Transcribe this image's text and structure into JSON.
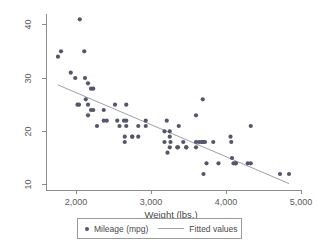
{
  "chart_data": {
    "type": "scatter",
    "title": "",
    "xlabel": "Weight (lbs.)",
    "ylabel": "",
    "xlim": [
      1600,
      5000
    ],
    "ylim": [
      9,
      42
    ],
    "xticks": [
      2000,
      3000,
      4000,
      5000
    ],
    "xticklabels": [
      "2,000",
      "3,000",
      "4,000",
      "5,000"
    ],
    "yticks": [
      10,
      20,
      30,
      40
    ],
    "yticklabels": [
      "10",
      "20",
      "30",
      "40"
    ],
    "grid": false,
    "legend_position": "bottom",
    "series": [
      {
        "name": "Mileage (mpg)",
        "type": "scatter",
        "marker": "circle",
        "color": "#54566b",
        "x": [
          2930,
          3350,
          2640,
          3250,
          4080,
          3670,
          3690,
          3180,
          3220,
          4060,
          3600,
          3600,
          3740,
          4130,
          2830,
          3250,
          4330,
          3900,
          4290,
          2110,
          2200,
          2670,
          3700,
          3690,
          3180,
          3430,
          3260,
          3600,
          2200,
          2520,
          2130,
          2650,
          2230,
          2370,
          2020,
          2280,
          2750,
          2120,
          2160,
          2550,
          2650,
          3250,
          4840,
          3360,
          3720,
          4130,
          3470,
          3210,
          3640,
          3830,
          2580,
          4330,
          4070,
          4720,
          3370,
          2830,
          2930,
          3470,
          4100,
          3690,
          2670,
          2750,
          2230,
          2370,
          2050,
          2410,
          1800,
          1760,
          2040,
          1930,
          1990,
          2160,
          2670,
          2160
        ],
        "y": [
          22,
          17,
          22,
          20,
          15,
          18,
          26,
          20,
          16,
          19,
          17,
          23,
          14,
          14,
          21,
          19,
          14,
          14,
          14,
          35,
          24,
          21,
          12,
          18,
          18,
          18,
          18,
          18,
          28,
          25,
          26,
          18,
          24,
          22,
          25,
          21,
          19,
          30,
          25,
          22,
          19,
          17,
          12,
          17,
          18,
          14,
          17,
          22,
          18,
          18,
          21,
          21,
          18,
          12,
          21,
          19,
          21,
          17,
          14,
          18,
          22,
          19,
          28,
          24,
          41,
          22,
          35,
          34,
          25,
          31,
          30,
          29,
          25,
          23
        ],
        "point_count": 74
      },
      {
        "name": "Fitted values",
        "type": "line",
        "color": "#9fa0ad",
        "x": [
          1760,
          4840
        ],
        "y": [
          28.7,
          10.2
        ],
        "fit": "linear"
      }
    ],
    "annotations": []
  },
  "axes": {
    "x_title": "Weight (lbs.)",
    "x_tick_labels": [
      "2,000",
      "3,000",
      "4,000",
      "5,000"
    ],
    "y_tick_labels": [
      "10",
      "20",
      "30",
      "40"
    ]
  },
  "legend": {
    "items": [
      {
        "label": "Mileage (mpg)",
        "marker": "circle-marker",
        "color": "#54566b"
      },
      {
        "label": "Fitted values",
        "marker": "line-marker",
        "color": "#9fa0ad"
      }
    ]
  },
  "colors": {
    "background": "#ffffff",
    "axis": "#8c8c8c",
    "tick_text": "#5a5a5a",
    "marker": "#54566b",
    "fit_line": "#9fa0ad",
    "legend_border": "#9a9a9a"
  }
}
